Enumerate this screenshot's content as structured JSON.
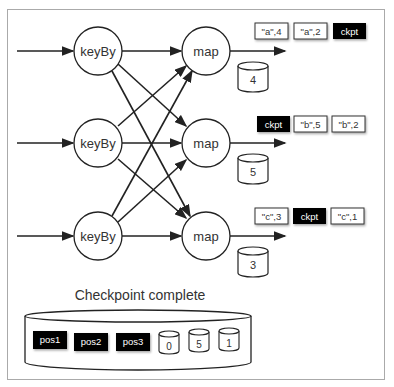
{
  "diagram": {
    "keyby_nodes": [
      {
        "label": "keyBy"
      },
      {
        "label": "keyBy"
      },
      {
        "label": "keyBy"
      }
    ],
    "map_nodes": [
      {
        "label": "map",
        "state": "4",
        "records": [
          {
            "text": "\"a\",4",
            "type": "record"
          },
          {
            "text": "\"a\",2",
            "type": "record"
          },
          {
            "text": "ckpt",
            "type": "barrier"
          }
        ]
      },
      {
        "label": "map",
        "state": "5",
        "records": [
          {
            "text": "ckpt",
            "type": "barrier"
          },
          {
            "text": "\"b\",5",
            "type": "record"
          },
          {
            "text": "\"b\",2",
            "type": "record"
          }
        ]
      },
      {
        "label": "map",
        "state": "3",
        "records": [
          {
            "text": "\"c\",3",
            "type": "record"
          },
          {
            "text": "ckpt",
            "type": "barrier"
          },
          {
            "text": "\"c\",1",
            "type": "record"
          }
        ]
      }
    ],
    "checkpoint": {
      "title": "Checkpoint complete",
      "positions": [
        "pos1",
        "pos2",
        "pos3"
      ],
      "states": [
        "0",
        "5",
        "1"
      ]
    }
  }
}
